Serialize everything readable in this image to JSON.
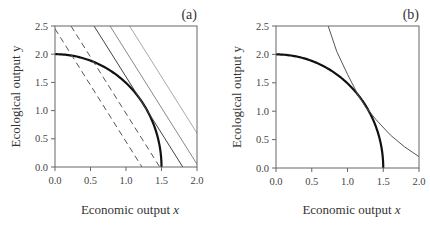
{
  "chart_data": [
    {
      "type": "line",
      "panel_label": "(a)",
      "xlabel": "Economic output",
      "xlabel_var": "x",
      "ylabel": "Ecological output y",
      "xlim": [
        0,
        2.0
      ],
      "ylim": [
        0,
        2.5
      ],
      "xticks": [
        "0.0",
        "0.5",
        "1.0",
        "1.5",
        "2.0"
      ],
      "yticks": [
        "0.0",
        "0.5",
        "1.0",
        "1.5",
        "2.0",
        "2.5"
      ],
      "grid": false,
      "series": [
        {
          "name": "production frontier",
          "style": "thick-black",
          "form": "(x/1.5)^2 + (y/2)^2 = 1",
          "x": [
            0,
            0.5,
            1.0,
            1.25,
            1.4,
            1.5
          ],
          "y": [
            2.0,
            1.886,
            1.491,
            1.106,
            0.718,
            0.0
          ]
        },
        {
          "name": "iso-value line 1",
          "style": "dashed",
          "slope": -2,
          "intercept": 2.45
        },
        {
          "name": "iso-value line 2",
          "style": "dashed",
          "slope": -2,
          "intercept": 2.95
        },
        {
          "name": "iso-value line 3 (tangent)",
          "style": "solid-dark",
          "slope": -2,
          "intercept": 3.6
        },
        {
          "name": "iso-value line 4",
          "style": "solid-gray",
          "slope": -2,
          "intercept": 4.05
        },
        {
          "name": "iso-value line 5",
          "style": "solid-lightgray",
          "slope": -2,
          "intercept": 4.6
        }
      ]
    },
    {
      "type": "line",
      "panel_label": "(b)",
      "xlabel": "Economic output",
      "xlabel_var": "x",
      "ylabel": "Ecological output y",
      "xlim": [
        0,
        2.0
      ],
      "ylim": [
        0,
        2.5
      ],
      "xticks": [
        "0.0",
        "0.5",
        "1.0",
        "1.5",
        "2.0"
      ],
      "yticks": [
        "0.0",
        "0.5",
        "1.0",
        "1.5",
        "2.0",
        "2.5"
      ],
      "grid": false,
      "series": [
        {
          "name": "production frontier",
          "style": "thick-black",
          "form": "(x/1.5)^2 + (y/2)^2 = 1",
          "x": [
            0,
            0.5,
            1.0,
            1.25,
            1.4,
            1.5
          ],
          "y": [
            2.0,
            1.886,
            1.491,
            1.106,
            0.718,
            0.0
          ]
        },
        {
          "name": "indifference curve",
          "style": "thin-dark",
          "x": [
            0.73,
            0.85,
            1.0,
            1.15,
            1.25,
            1.4,
            1.6,
            1.8,
            2.0
          ],
          "y": [
            2.5,
            2.05,
            1.65,
            1.28,
            1.08,
            0.85,
            0.58,
            0.37,
            0.2
          ]
        }
      ]
    }
  ]
}
